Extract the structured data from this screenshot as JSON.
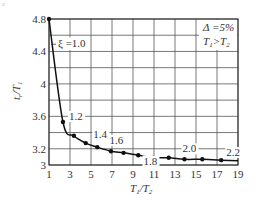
{
  "chart_data": {
    "type": "line",
    "title": "",
    "xlabel": "T1/T2",
    "ylabel": "tr/T1",
    "xlim": [
      1,
      19
    ],
    "ylim": [
      3.0,
      4.8
    ],
    "grid": true,
    "x_ticks": [
      "1",
      "3",
      "5",
      "7",
      "9",
      "11",
      "13",
      "15",
      "17",
      "19"
    ],
    "y_ticks": [
      "4.8",
      "4.4",
      "4",
      "3.6",
      "3.2",
      "3"
    ],
    "annotation_box": [
      "Δ=5%",
      "T1>T2"
    ],
    "series": [
      {
        "name": "tr/T1 vs T1/T2",
        "x": [
          1.0,
          2.33,
          3.37,
          4.5,
          5.6,
          6.9,
          8.1,
          9.5,
          10.95,
          12.4,
          13.9,
          15.6,
          17.4
        ],
        "y": [
          4.8,
          3.53,
          3.36,
          3.27,
          3.22,
          3.17,
          3.15,
          3.12,
          3.09,
          3.09,
          3.07,
          3.07,
          3.06
        ]
      }
    ],
    "point_labels": [
      {
        "text": "ξ =1.0",
        "x": 1.0,
        "y": 4.8
      },
      {
        "text": "1.2",
        "x": 2.33,
        "y": 3.53
      },
      {
        "text": "1.4",
        "x": 5.6,
        "y": 3.22
      },
      {
        "text": "1.6",
        "x": 8.1,
        "y": 3.15
      },
      {
        "text": "1.8",
        "x": 10.95,
        "y": 3.09
      },
      {
        "text": "2.0",
        "x": 13.9,
        "y": 3.07
      },
      {
        "text": "2.2",
        "x": 17.4,
        "y": 3.06
      }
    ]
  },
  "labels": {
    "xlabel_main": "T",
    "xlabel_sub1": "1",
    "xlabel_sep": "/T",
    "xlabel_sub2": "2",
    "ylabel_main": "t",
    "ylabel_sub1": "r",
    "ylabel_sep": "/T",
    "ylabel_sub2": "1",
    "box_line1": "Δ =5%",
    "box_line2_a": "T",
    "box_line2_sub1": "1",
    "box_line2_gt": ">T",
    "box_line2_sub2": "2",
    "corner_mark": "a"
  }
}
